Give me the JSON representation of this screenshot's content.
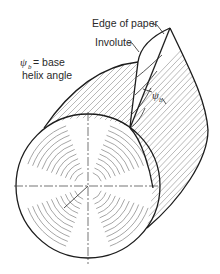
{
  "figure": {
    "labels": {
      "edge_of_paper": "Edge of paper",
      "involute": "Involute",
      "psi_symbol": "ψ",
      "psi_subscript": "b",
      "psi_definition_suffix": "= base",
      "psi_definition_line2": "helix angle",
      "angle_marker_symbol": "ψ",
      "angle_marker_subscript": "b"
    },
    "colors": {
      "ink": "#1c1c1c",
      "hatch": "#9a9a9a",
      "background": "#ffffff"
    }
  }
}
